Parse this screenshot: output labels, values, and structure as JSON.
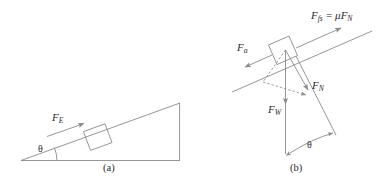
{
  "figure": {
    "type": "physics-free-body-diagram",
    "background_color": "#ffffff",
    "line_color": "#8a8a8a",
    "text_color": "#2b2b2b",
    "panels": [
      {
        "id": "a",
        "caption": "(a)",
        "description": "Block resting on an inclined plane of angle theta, pushed by applied force F sub E directed up the incline."
      },
      {
        "id": "b",
        "caption": "(b)",
        "description": "Free-body force decomposition for the block on the incline showing static friction, applied force, normal force and weight."
      }
    ]
  },
  "panel_a": {
    "caption": "(a)",
    "angle_label": "θ",
    "force_label": {
      "symbol": "F",
      "subscript": "E",
      "full": "F_E"
    }
  },
  "panel_b": {
    "caption": "(b)",
    "angle_label": "θ",
    "friction_force": {
      "symbol": "F",
      "subscript": "fs",
      "operator": "=",
      "coefficient": "μ",
      "rhs_symbol": "F",
      "rhs_subscript": "N",
      "full": "F_fs = μF_N"
    },
    "applied_force": {
      "symbol": "F",
      "subscript": "a",
      "full": "F_a"
    },
    "normal_force": {
      "symbol": "F",
      "subscript": "N",
      "full": "F_N"
    },
    "weight_force": {
      "symbol": "F",
      "subscript": "W",
      "full": "F_W"
    }
  }
}
